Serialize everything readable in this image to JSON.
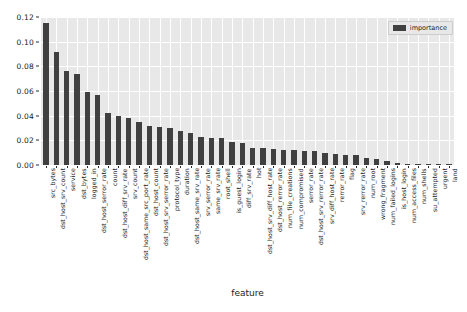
{
  "chart_data": {
    "type": "bar",
    "title": "",
    "xlabel": "feature",
    "ylabel": "",
    "ylim": [
      0.0,
      0.12
    ],
    "yticks": [
      "0.00",
      "0.02",
      "0.04",
      "0.06",
      "0.08",
      "0.10",
      "0.12"
    ],
    "ytick_values": [
      0.0,
      0.02,
      0.04,
      0.06,
      0.08,
      0.1,
      0.12
    ],
    "grid": true,
    "legend_position": "upper right",
    "legend": [
      "importance"
    ],
    "series_name": "importance",
    "bar_color": "#404040",
    "plot_bgcolor": "#e8e8e8",
    "grid_color": "#ffffff",
    "categories": [
      "src_bytes",
      "dst_host_srv_count",
      "service",
      "dst_bytes",
      "logged_in",
      "dst_host_serror_rate",
      "count",
      "dst_host_diff_srv_rate",
      "srv_count",
      "dst_host_same_src_port_rate",
      "dst_host_count",
      "dst_host_srv_serror_rate",
      "protocol_type",
      "duration",
      "dst_host_same_srv_rate",
      "srv_serror_rate",
      "same_srv_rate",
      "root_shell",
      "is_guest_login",
      "diff_srv_rate",
      "hot",
      "dst_host_srv_diff_host_rate",
      "dst_host_rerror_rate",
      "num_file_creations",
      "num_compromised",
      "serror_rate",
      "dst_host_srv_rerror_rate",
      "srv_diff_host_rate",
      "rerror_rate",
      "flag",
      "srv_rerror_rate",
      "num_root",
      "wrong_fragment",
      "num_failed_logins",
      "is_host_login",
      "num_access_files",
      "num_shells",
      "su_attempted",
      "urgent",
      "land"
    ],
    "values": [
      0.1155,
      0.0915,
      0.0765,
      0.074,
      0.059,
      0.057,
      0.0425,
      0.04,
      0.038,
      0.035,
      0.0315,
      0.031,
      0.03,
      0.0275,
      0.026,
      0.023,
      0.022,
      0.0215,
      0.0185,
      0.018,
      0.014,
      0.0135,
      0.013,
      0.0125,
      0.012,
      0.0115,
      0.011,
      0.01,
      0.009,
      0.0085,
      0.008,
      0.006,
      0.005,
      0.003,
      0.0018,
      0.0012,
      0.0008,
      0.0005,
      0.0003,
      0.0002
    ]
  }
}
